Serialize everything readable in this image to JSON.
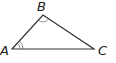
{
  "diagram": {
    "type": "triangle",
    "vertices": [
      {
        "label": "A",
        "x": 12,
        "y": 49,
        "angle_marks": 2
      },
      {
        "label": "B",
        "x": 43,
        "y": 15,
        "angle_marks": 1
      },
      {
        "label": "C",
        "x": 94,
        "y": 49,
        "angle_marks": 0
      }
    ],
    "stroke_color": "#333333"
  }
}
